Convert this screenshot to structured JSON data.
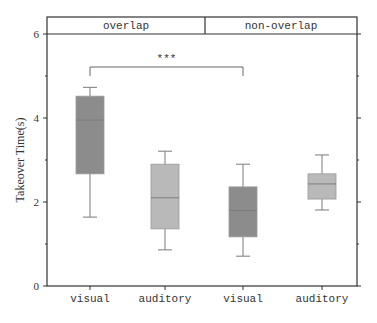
{
  "chart_data": {
    "type": "box",
    "title": "",
    "xlabel": "",
    "ylabel": "Takeover Time(s)",
    "ylim": [
      0,
      6
    ],
    "yticks": [
      0,
      2,
      4,
      6
    ],
    "panels": [
      {
        "label": "overlap",
        "categories": [
          "visual",
          "auditory"
        ]
      },
      {
        "label": "non-overlap",
        "categories": [
          "visual",
          "auditory"
        ]
      }
    ],
    "categories": [
      "visual",
      "auditory",
      "visual",
      "auditory"
    ],
    "series": [
      {
        "name": "overlap-visual",
        "panel": "overlap",
        "whisker_low": 1.64,
        "q1": 2.67,
        "median": 3.95,
        "q3": 4.52,
        "whisker_high": 4.73,
        "color": "#8c8c8c"
      },
      {
        "name": "overlap-auditory",
        "panel": "overlap",
        "whisker_low": 0.86,
        "q1": 1.36,
        "median": 2.1,
        "q3": 2.9,
        "whisker_high": 3.21,
        "color": "#b9b9b9"
      },
      {
        "name": "non-overlap-visual",
        "panel": "non-overlap",
        "whisker_low": 0.71,
        "q1": 1.17,
        "median": 1.8,
        "q3": 2.36,
        "whisker_high": 2.9,
        "color": "#8c8c8c"
      },
      {
        "name": "non-overlap-auditory",
        "panel": "non-overlap",
        "whisker_low": 1.81,
        "q1": 2.07,
        "median": 2.43,
        "q3": 2.67,
        "whisker_high": 3.12,
        "color": "#b9b9b9"
      }
    ],
    "annotations": [
      {
        "type": "significance-bracket",
        "from": 0,
        "to": 2,
        "y": 5.3,
        "label": "***"
      }
    ],
    "grid": false,
    "legend": null
  }
}
